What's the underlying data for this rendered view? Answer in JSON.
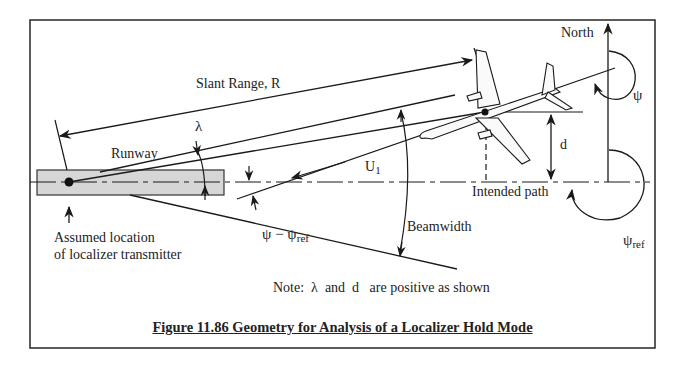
{
  "figure": {
    "caption": "Figure 11.86 Geometry for Analysis of a Localizer Hold Mode",
    "note": "Note:  λ  and  d   are positive as shown"
  },
  "labels": {
    "slant_range": "Slant Range, R",
    "lambda": "λ",
    "runway": "Runway",
    "u1_main": "U",
    "u1_sub": "1",
    "d": "d",
    "north": "North",
    "psi": "ψ",
    "intended_path": "Intended path",
    "psi_minus": "ψ − ψ",
    "psi_ref_sub": "ref",
    "psi_ref_main": "ψ",
    "beamwidth": "Beamwidth",
    "assumed_location_line1": "Assumed location",
    "assumed_location_line2": "of localizer transmitter"
  },
  "colors": {
    "line": "#1a1a1a",
    "runway_fill": "#d6d6d6",
    "frame": "#333333"
  }
}
